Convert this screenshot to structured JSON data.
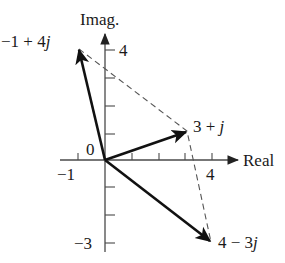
{
  "diagram": {
    "axes": {
      "x_label": "Real",
      "y_label": "Imag.",
      "x_ticks": [
        -1,
        1,
        2,
        3,
        4
      ],
      "y_ticks": [
        -3,
        -2,
        -1,
        1,
        2,
        3,
        4
      ],
      "x_tick_labels": {
        "neg1": "−1",
        "four": "4"
      },
      "y_tick_labels": {
        "four": "4",
        "neg3": "−3"
      },
      "origin_label": "0"
    },
    "vectors": [
      {
        "name": "v1",
        "re": -1,
        "im": 4,
        "label_a": "−1 + 4",
        "label_j": "j"
      },
      {
        "name": "v2",
        "re": 3,
        "im": 1,
        "label_a": "3 + ",
        "label_j": "j"
      },
      {
        "name": "v3",
        "re": 4,
        "im": -3,
        "label_a": "4 − 3",
        "label_j": "j"
      }
    ],
    "dashed_path": [
      {
        "re": -1,
        "im": 4
      },
      {
        "re": 3,
        "im": 1
      },
      {
        "re": 4,
        "im": -3
      }
    ],
    "colors": {
      "vector": "#111111",
      "axis": "#4a4a4a",
      "dashed": "#555555",
      "background": "#ffffff"
    }
  }
}
